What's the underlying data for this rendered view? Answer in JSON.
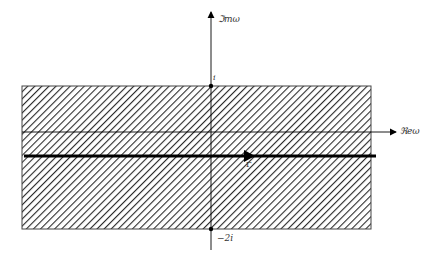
{
  "diagram": {
    "axes": {
      "imag_label": "ℑmω",
      "real_label": "ℜeω"
    },
    "points": {
      "upper": "i",
      "lower": "−2i"
    },
    "contour_label": "Γ",
    "strip": {
      "hatched": true,
      "upper_bound": "i",
      "lower_bound": "−2i"
    },
    "colors": {
      "line": "#000000",
      "hatch": "#333333",
      "background": "#ffffff"
    }
  }
}
